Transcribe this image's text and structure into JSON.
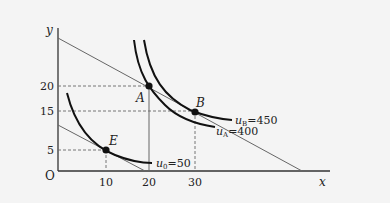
{
  "diagram": {
    "axes": {
      "x_label": "x",
      "y_label": "y",
      "origin_label": "O"
    },
    "x_ticks": [
      "10",
      "20",
      "30"
    ],
    "y_ticks": [
      "5",
      "15",
      "20"
    ],
    "points": [
      {
        "name": "A",
        "x": 20,
        "y": 20
      },
      {
        "name": "B",
        "x": 30,
        "y": 15
      },
      {
        "name": "E",
        "x": 10,
        "y": 5
      }
    ],
    "curves": [
      {
        "label_var": "u",
        "label_sub": "B",
        "label_value": "=450"
      },
      {
        "label_var": "u",
        "label_sub": "A",
        "label_value": "=400"
      },
      {
        "label_var": "u",
        "label_sub": "0",
        "label_value": "=50"
      }
    ],
    "colors": {
      "background": "#f4f4f4",
      "curve": "#111111",
      "line": "#555555",
      "dashed": "#555555"
    }
  }
}
